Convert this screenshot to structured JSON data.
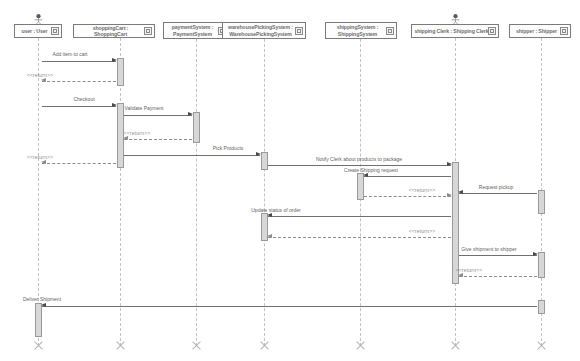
{
  "diagram": {
    "type": "uml-sequence-diagram",
    "colors": {
      "lifeline": "#c2c2c2",
      "activation_fill": "#d7d7d7",
      "activation_border": "#9a9a9a",
      "message_line": "#6f6f6f",
      "return_line": "#8d8d8d",
      "text": "#5f5f5f",
      "head_border": "#7a7a7a"
    },
    "lifelines": [
      {
        "id": "user",
        "label": "user : User",
        "x": 38,
        "head_x": 14,
        "head_y": 24,
        "head_w": 48,
        "head_h": 14,
        "actor": true,
        "multiline": false
      },
      {
        "id": "cart",
        "label": "shoppingCart : ShoppingCart",
        "x": 120,
        "head_x": 73,
        "head_y": 24,
        "head_w": 82,
        "head_h": 14,
        "actor": false,
        "multiline": false
      },
      {
        "id": "payment",
        "label": "paymentSystem : PaymentSystem",
        "x": 196,
        "head_x": 163,
        "head_y": 22,
        "head_w": 66,
        "head_h": 17,
        "actor": false,
        "multiline": true
      },
      {
        "id": "warehouse",
        "label": "warehousePickingSystem : WarehousePickingSystem",
        "x": 264,
        "head_x": 222,
        "head_y": 22,
        "head_w": 84,
        "head_h": 17,
        "actor": false,
        "multiline": true
      },
      {
        "id": "shipping",
        "label": "shippingSystem : ShippingSystem",
        "x": 360,
        "head_x": 325,
        "head_y": 22,
        "head_w": 72,
        "head_h": 17,
        "actor": false,
        "multiline": true
      },
      {
        "id": "clerk",
        "label": "shipping Clerk : Shipping Clerk",
        "x": 455,
        "head_x": 411,
        "head_y": 24,
        "head_w": 88,
        "head_h": 14,
        "actor": true,
        "multiline": false
      },
      {
        "id": "shipper",
        "label": "shipper : Shipper",
        "x": 541,
        "head_x": 509,
        "head_y": 24,
        "head_w": 62,
        "head_h": 14,
        "actor": false,
        "multiline": false
      }
    ],
    "messages": [
      {
        "id": "m1",
        "label": "Add item to cart",
        "from": "user",
        "to": "cart",
        "y": 61,
        "kind": "call",
        "label_x": 70,
        "label_y": 51
      },
      {
        "id": "m2",
        "label": "<<return>>",
        "from": "cart",
        "to": "user",
        "y": 81,
        "kind": "return",
        "label_x": 40,
        "label_y": 72
      },
      {
        "id": "m3",
        "label": "Checkout",
        "from": "user",
        "to": "cart",
        "y": 106,
        "kind": "call",
        "label_x": 84,
        "label_y": 96
      },
      {
        "id": "m4",
        "label": "Validate Payment",
        "from": "cart",
        "to": "payment",
        "y": 115,
        "kind": "call",
        "label_x": 144,
        "label_y": 105
      },
      {
        "id": "m5",
        "label": "<<return>>",
        "from": "payment",
        "to": "cart",
        "y": 139,
        "kind": "return",
        "label_x": 137,
        "label_y": 130
      },
      {
        "id": "m6",
        "label": "<<return>>",
        "from": "cart",
        "to": "user",
        "y": 163,
        "kind": "return",
        "label_x": 40,
        "label_y": 154
      },
      {
        "id": "m7",
        "label": "Pick Products",
        "from": "cart",
        "to": "warehouse",
        "y": 155,
        "kind": "call",
        "label_x": 228,
        "label_y": 145
      },
      {
        "id": "m8",
        "label": "Notify Clerk about products to package",
        "from": "warehouse",
        "to": "clerk",
        "y": 165,
        "kind": "call",
        "label_x": 359,
        "label_y": 156
      },
      {
        "id": "m9",
        "label": "Create Shipping request",
        "from": "clerk",
        "to": "shipping",
        "y": 176,
        "kind": "call",
        "label_x": 371,
        "label_y": 167
      },
      {
        "id": "m10",
        "label": "<<return>>",
        "from": "shipping",
        "to": "clerk",
        "y": 196,
        "kind": "return",
        "label_x": 422,
        "label_y": 187
      },
      {
        "id": "m11",
        "label": "Request pickup",
        "from": "shipper",
        "to": "clerk",
        "y": 193,
        "kind": "call",
        "label_x": 496,
        "label_y": 184
      },
      {
        "id": "m12",
        "label": "Update status of order",
        "from": "clerk",
        "to": "warehouse",
        "y": 216,
        "kind": "call",
        "label_x": 276,
        "label_y": 207
      },
      {
        "id": "m13",
        "label": "<<return>>",
        "from": "clerk",
        "to": "warehouse",
        "y": 237,
        "kind": "return",
        "label_x": 422,
        "label_y": 228
      },
      {
        "id": "m14",
        "label": "Give shipment to shipper",
        "from": "clerk",
        "to": "shipper",
        "y": 255,
        "kind": "call",
        "label_x": 489,
        "label_y": 246
      },
      {
        "id": "m15",
        "label": "<<return>>",
        "from": "shipper",
        "to": "clerk",
        "y": 276,
        "kind": "return",
        "label_x": 469,
        "label_y": 267
      },
      {
        "id": "m16",
        "label": "Deliver Shipment",
        "from": "shipper",
        "to": "user",
        "y": 306,
        "kind": "call",
        "label_x": 42,
        "label_y": 296
      }
    ],
    "activations": [
      {
        "id": "a1",
        "lifeline": "cart",
        "y": 58,
        "h": 28
      },
      {
        "id": "a2",
        "lifeline": "cart",
        "y": 103,
        "h": 65
      },
      {
        "id": "a3",
        "lifeline": "payment",
        "y": 112,
        "h": 31
      },
      {
        "id": "a4",
        "lifeline": "warehouse",
        "y": 152,
        "h": 18
      },
      {
        "id": "a5",
        "lifeline": "clerk",
        "y": 162,
        "h": 122
      },
      {
        "id": "a6",
        "lifeline": "shipping",
        "y": 173,
        "h": 27
      },
      {
        "id": "a7",
        "lifeline": "shipper",
        "y": 190,
        "h": 24
      },
      {
        "id": "a8",
        "lifeline": "warehouse",
        "y": 213,
        "h": 28
      },
      {
        "id": "a9",
        "lifeline": "shipper",
        "y": 252,
        "h": 26
      },
      {
        "id": "a10",
        "lifeline": "shipper",
        "y": 300,
        "h": 14
      },
      {
        "id": "a11",
        "lifeline": "user",
        "y": 303,
        "h": 34
      }
    ],
    "destructions": [
      {
        "lifeline": "user",
        "y": 340
      },
      {
        "lifeline": "cart",
        "y": 340
      },
      {
        "lifeline": "payment",
        "y": 340
      },
      {
        "lifeline": "warehouse",
        "y": 340
      },
      {
        "lifeline": "shipping",
        "y": 340
      },
      {
        "lifeline": "clerk",
        "y": 340
      },
      {
        "lifeline": "shipper",
        "y": 340
      }
    ]
  }
}
